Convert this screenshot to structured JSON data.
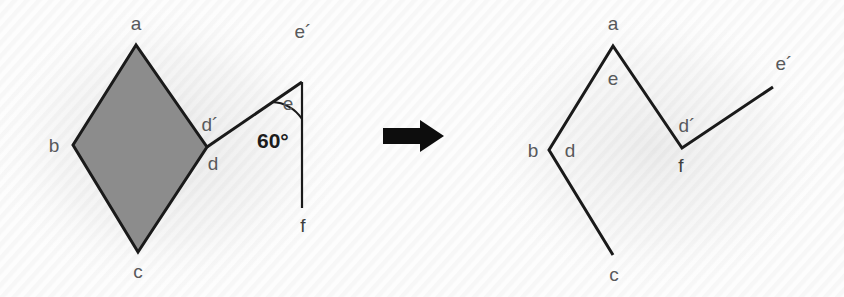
{
  "figure": {
    "background_color": "#fdfdfd",
    "line_color": "#1a1a1a",
    "label_color": "#58595b",
    "fill_color": "#8c8c8c",
    "arrow": {
      "name": "transformation-arrow",
      "direction": "right"
    }
  },
  "left_panel": {
    "name": "source-figure",
    "shape": {
      "name": "shaded-rhombus",
      "fill": "#8c8c8c",
      "vertices": [
        {
          "label": "a",
          "x": 136,
          "y": 45
        },
        {
          "label": "b",
          "x": 73,
          "y": 145
        },
        {
          "label": "c",
          "x": 138,
          "y": 252
        },
        {
          "label": "d",
          "x": 207,
          "y": 147
        }
      ]
    },
    "labels": [
      {
        "id": "a",
        "text": "a",
        "x": 136,
        "y": 30
      },
      {
        "id": "b",
        "text": "b",
        "x": 54,
        "y": 152
      },
      {
        "id": "c",
        "text": "c",
        "x": 138,
        "y": 278
      },
      {
        "id": "d",
        "text": "d",
        "x": 213,
        "y": 170
      },
      {
        "id": "dprime",
        "text": "d´",
        "x": 210,
        "y": 131
      },
      {
        "id": "e",
        "text": "e",
        "x": 288,
        "y": 110
      },
      {
        "id": "eprime",
        "text": "e´",
        "x": 303,
        "y": 38
      },
      {
        "id": "f",
        "text": "f",
        "x": 303,
        "y": 232
      }
    ],
    "angle": {
      "name": "angle-60-degrees",
      "text": "60°",
      "value": 60,
      "unit": "degrees",
      "x": 257,
      "y": 148,
      "vertex": {
        "x": 302,
        "y": 82
      }
    },
    "segments": [
      {
        "name": "segment-d-eprime",
        "from": {
          "x": 207,
          "y": 147
        },
        "to": {
          "x": 302,
          "y": 82
        }
      },
      {
        "name": "segment-eprime-f",
        "from": {
          "x": 302,
          "y": 82
        },
        "to": {
          "x": 302,
          "y": 208
        }
      }
    ]
  },
  "right_panel": {
    "name": "result-figure",
    "polyline": {
      "name": "unfolded-chain",
      "vertices": [
        {
          "label": "c",
          "x": 613,
          "y": 255
        },
        {
          "label": "b",
          "x": 549,
          "y": 150
        },
        {
          "label": "a",
          "x": 613,
          "y": 46
        },
        {
          "label": "f",
          "x": 682,
          "y": 148
        },
        {
          "label": "e´",
          "x": 773,
          "y": 87
        }
      ]
    },
    "labels": [
      {
        "id": "a",
        "text": "a",
        "x": 613,
        "y": 30
      },
      {
        "id": "e",
        "text": "e",
        "x": 613,
        "y": 85
      },
      {
        "id": "b",
        "text": "b",
        "x": 533,
        "y": 157
      },
      {
        "id": "d",
        "text": "d",
        "x": 570,
        "y": 157
      },
      {
        "id": "c",
        "text": "c",
        "x": 614,
        "y": 281
      },
      {
        "id": "dprime",
        "text": "d´",
        "x": 687,
        "y": 132
      },
      {
        "id": "f",
        "text": "f",
        "x": 681,
        "y": 172
      },
      {
        "id": "eprime",
        "text": "e´",
        "x": 784,
        "y": 70
      }
    ]
  }
}
